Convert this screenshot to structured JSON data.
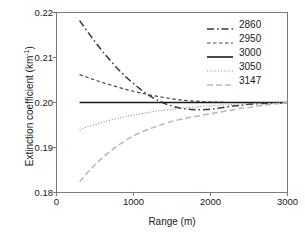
{
  "chart_data": {
    "type": "line",
    "title": "",
    "xlabel": "Range (m)",
    "ylabel_main": "Extinction coefficient (km",
    "ylabel_exp": "-1",
    "ylabel_close": ")",
    "ylabel": "Extinction coefficient (km-1)",
    "xlim": [
      0,
      3000
    ],
    "ylim": [
      0.18,
      0.22
    ],
    "xticks": [
      0,
      1000,
      2000,
      3000
    ],
    "xtick_labels": [
      "0",
      "1000",
      "2000",
      "3000"
    ],
    "yticks": [
      0.18,
      0.19,
      0.2,
      0.21,
      0.22
    ],
    "ytick_labels": [
      "0.18",
      "0.19",
      "0.20",
      "0.21",
      "0.22"
    ],
    "grid": false,
    "legend_position": "upper right",
    "legend_title": "",
    "x": [
      300,
      400,
      500,
      600,
      700,
      800,
      900,
      1000,
      1100,
      1200,
      1300,
      1400,
      1500,
      1600,
      1700,
      1800,
      1900,
      2000,
      2100,
      2200,
      2300,
      2400,
      2500,
      2600,
      2700,
      2800,
      2900,
      3000
    ],
    "series": [
      {
        "name": "2860",
        "label": "2860",
        "color": "#3a3a3a",
        "style": "dash-dot",
        "width": 1.5,
        "values": [
          0.2182,
          0.2158,
          0.2135,
          0.2113,
          0.2093,
          0.2074,
          0.2057,
          0.2042,
          0.2028,
          0.2016,
          0.2006,
          0.1998,
          0.1992,
          0.1988,
          0.1985,
          0.1984,
          0.1984,
          0.1985,
          0.1987,
          0.199,
          0.1992,
          0.1994,
          0.1996,
          0.1997,
          0.1998,
          0.1999,
          0.1999,
          0.2
        ]
      },
      {
        "name": "2950",
        "label": "2950",
        "color": "#4a4a4a",
        "style": "dotted-dash",
        "width": 1.2,
        "values": [
          0.2062,
          0.2056,
          0.205,
          0.2044,
          0.2039,
          0.2034,
          0.2029,
          0.2025,
          0.2021,
          0.2017,
          0.2014,
          0.2011,
          0.2008,
          0.2006,
          0.2004,
          0.2003,
          0.2002,
          0.2001,
          0.2001,
          0.2,
          0.2,
          0.2,
          0.2,
          0.2,
          0.2,
          0.2,
          0.2,
          0.2
        ]
      },
      {
        "name": "3000",
        "label": "3000",
        "color": "#1a1a1a",
        "style": "solid",
        "width": 1.6,
        "values": [
          0.2,
          0.2,
          0.2,
          0.2,
          0.2,
          0.2,
          0.2,
          0.2,
          0.2,
          0.2,
          0.2,
          0.2,
          0.2,
          0.2,
          0.2,
          0.2,
          0.2,
          0.2,
          0.2,
          0.2,
          0.2,
          0.2,
          0.2,
          0.2,
          0.2,
          0.2,
          0.2,
          0.2
        ]
      },
      {
        "name": "3050",
        "label": "3050",
        "color": "#8a8a8a",
        "style": "fine-dotted",
        "width": 1.1,
        "values": [
          0.194,
          0.1946,
          0.1951,
          0.1956,
          0.1961,
          0.1965,
          0.1969,
          0.1972,
          0.1975,
          0.1978,
          0.1981,
          0.1983,
          0.1985,
          0.1987,
          0.1989,
          0.199,
          0.1992,
          0.1993,
          0.1994,
          0.1995,
          0.1996,
          0.1997,
          0.1997,
          0.1998,
          0.1999,
          0.1999,
          0.2,
          0.2
        ]
      },
      {
        "name": "3147",
        "label": "3147",
        "color": "#b8b8b8",
        "style": "light-dashed",
        "width": 1.5,
        "values": [
          0.1824,
          0.1844,
          0.1862,
          0.1878,
          0.1892,
          0.1905,
          0.1916,
          0.1926,
          0.1934,
          0.1941,
          0.1947,
          0.1953,
          0.1958,
          0.1962,
          0.1966,
          0.1969,
          0.1972,
          0.1975,
          0.1978,
          0.1981,
          0.1984,
          0.1987,
          0.1989,
          0.1992,
          0.1994,
          0.1996,
          0.1998,
          0.2
        ]
      }
    ]
  }
}
